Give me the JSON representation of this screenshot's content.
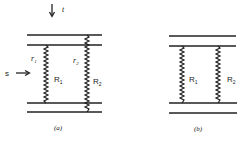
{
  "panels": [
    {
      "id": "a",
      "caption": "(a)",
      "labels": {
        "t": "t",
        "s": "s",
        "r1": "r",
        "r1_sub": "1",
        "r2": "r",
        "r2_sub": "2",
        "R1": "R",
        "R1_sub": "1",
        "R2": "R",
        "R2_sub": "2"
      }
    },
    {
      "id": "b",
      "caption": "(b)",
      "labels": {
        "R1": "R",
        "R1_sub": "1",
        "R2": "R",
        "R2_sub": "2"
      }
    }
  ],
  "colors": {
    "line": "#222222",
    "background": "#ffffff"
  }
}
